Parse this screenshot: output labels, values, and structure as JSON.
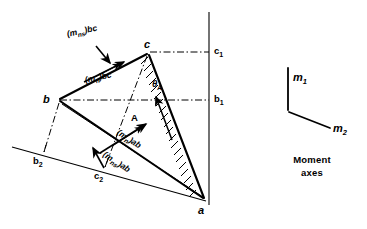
{
  "figure": {
    "vertices": [
      {
        "id": "a",
        "label": "a",
        "x": 205,
        "y": 200
      },
      {
        "id": "b",
        "label": "b",
        "x": 57,
        "y": 100
      },
      {
        "id": "c",
        "label": "c",
        "x": 148,
        "y": 52
      }
    ],
    "reference_points": [
      {
        "id": "c1",
        "label": "c",
        "sub": "1",
        "x": 213,
        "y": 52
      },
      {
        "id": "b1",
        "label": "b",
        "sub": "1",
        "x": 213,
        "y": 100
      },
      {
        "id": "b2",
        "label": "b",
        "sub": "2",
        "x": 40,
        "y": 154
      },
      {
        "id": "c2",
        "label": "c",
        "sub": "2",
        "x": 100,
        "y": 170
      }
    ],
    "vectors": [
      {
        "id": "mns_bc",
        "label": "(m",
        "sub": "ns",
        "suffix": ")bc",
        "x": 70,
        "y": 35
      },
      {
        "id": "mn_bc",
        "label": "(m",
        "sub": "n",
        "suffix": ")bc",
        "x": 88,
        "y": 81
      },
      {
        "id": "mn_ab",
        "label": "(m",
        "sub": "n",
        "suffix": ")ab",
        "x": 123,
        "y": 132
      },
      {
        "id": "mns_ab",
        "label": "(m",
        "sub": "ns",
        "suffix": ")ab",
        "x": 110,
        "y": 155
      }
    ],
    "angle_label": {
      "label": "θ",
      "sub": "A",
      "x": 155,
      "y": 84
    },
    "area_label": {
      "label": "A",
      "x": 133,
      "y": 118
    }
  },
  "legend": {
    "caption_line1": "Moment",
    "caption_line2": "axes",
    "axis1": {
      "label": "m",
      "sub": "1",
      "x": 295,
      "y": 78
    },
    "axis2": {
      "label": "m",
      "sub": "2",
      "x": 332,
      "y": 127
    }
  },
  "style": {
    "stroke": "#000000",
    "background": "#ffffff"
  }
}
